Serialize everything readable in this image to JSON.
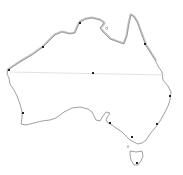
{
  "map": {
    "subject": "Australia outline map",
    "colors": {
      "background": "#ffffff",
      "coast_line": "#8a8a8a",
      "coast_shade": "#bdbdbd",
      "latitude_line": "#d4d4d4",
      "marker": "#222222"
    },
    "markers": [
      {
        "name": "center-marker",
        "x": 93,
        "y": 73
      },
      {
        "name": "northwest-coast-marker",
        "x": 43,
        "y": 47
      },
      {
        "name": "north-coast-marker",
        "x": 80,
        "y": 23
      },
      {
        "name": "northeast-coast-marker",
        "x": 145,
        "y": 44
      },
      {
        "name": "east-coast-marker",
        "x": 170,
        "y": 96
      },
      {
        "name": "southeast-coast-marker",
        "x": 157,
        "y": 124
      },
      {
        "name": "south-coast-marker",
        "x": 110,
        "y": 123
      },
      {
        "name": "south-coast-marker-2",
        "x": 132,
        "y": 137
      },
      {
        "name": "southwest-coast-marker",
        "x": 23,
        "y": 113
      },
      {
        "name": "west-coast-marker",
        "x": 9,
        "y": 70
      },
      {
        "name": "tasmania-marker",
        "x": 137,
        "y": 163
      }
    ]
  }
}
